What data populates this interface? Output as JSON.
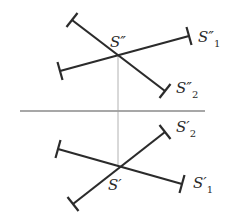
{
  "diagram": {
    "type": "orthographic-projection",
    "top_view": {
      "intersection_label": "S″",
      "segments": [
        {
          "label": "S″",
          "subscript": "1",
          "x1": 60,
          "y1": 71,
          "x2": 189,
          "y2": 36
        },
        {
          "label": "S″",
          "subscript": "2",
          "x1": 72,
          "y1": 20,
          "x2": 165,
          "y2": 91
        }
      ],
      "intersection": {
        "x": 118,
        "y": 56
      }
    },
    "bottom_view": {
      "intersection_label": "S′",
      "segments": [
        {
          "label": "S′",
          "subscript": "1",
          "x1": 58,
          "y1": 149,
          "x2": 182,
          "y2": 184
        },
        {
          "label": "S′",
          "subscript": "2",
          "x1": 73,
          "y1": 204,
          "x2": 165,
          "y2": 132
        }
      ],
      "intersection": {
        "x": 118,
        "y": 167
      }
    },
    "ground_line": {
      "x1": 20,
      "y1": 111,
      "x2": 205,
      "y2": 111
    },
    "projection_line": {
      "x": 118,
      "y1": 56,
      "y2": 167
    },
    "labels": {
      "s_top": "S″",
      "s1_top": "S″",
      "s1_top_sub": "1",
      "s2_top": "S″",
      "s2_top_sub": "2",
      "s_bottom": "S′",
      "s1_bottom": "S′",
      "s1_bottom_sub": "1",
      "s2_bottom": "S′",
      "s2_bottom_sub": "2"
    }
  }
}
